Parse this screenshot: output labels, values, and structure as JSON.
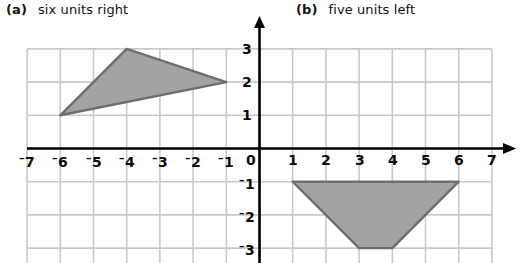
{
  "figure": {
    "title_a_tag": "(a)",
    "title_a_text": "six units right",
    "title_b_tag": "(b)",
    "title_b_text": "five units left"
  },
  "colors": {
    "background": "#ffffff",
    "grid": "#c9c9c9",
    "axis": "#000000",
    "shape_fill": "#a3a3a3",
    "shape_stroke": "#6e6e6e",
    "label_text": "#0b0b0b"
  },
  "chart_data": {
    "type": "scatter",
    "title": "",
    "xlabel": "",
    "ylabel": "",
    "xlim": [
      -7,
      7
    ],
    "ylim": [
      -3,
      3
    ],
    "grid": true,
    "legend": "none",
    "x_ticks": [
      "-7",
      "-6",
      "-5",
      "-4",
      "-3",
      "-2",
      "-1",
      "0",
      "1",
      "2",
      "3",
      "4",
      "5",
      "6",
      "7"
    ],
    "y_ticks": [
      "3",
      "2",
      "1",
      "-1",
      "-2",
      "-3"
    ],
    "origin_label": "0",
    "shapes": [
      {
        "name": "triangle",
        "label": "(a) six units right",
        "quadrant": "upper-left",
        "vertices": [
          [
            -6,
            1
          ],
          [
            -4,
            3
          ],
          [
            -1,
            2
          ]
        ]
      },
      {
        "name": "trapezoid",
        "label": "(b) five units left",
        "quadrant": "lower-right",
        "vertices": [
          [
            1,
            -1
          ],
          [
            6,
            -1
          ],
          [
            4,
            -3
          ],
          [
            3,
            -3
          ]
        ]
      }
    ]
  },
  "x_tick_labels": [
    {
      "value": -7,
      "sign": "neg",
      "digit": "7"
    },
    {
      "value": -6,
      "sign": "neg",
      "digit": "6"
    },
    {
      "value": -5,
      "sign": "neg",
      "digit": "5"
    },
    {
      "value": -4,
      "sign": "neg",
      "digit": "4"
    },
    {
      "value": -3,
      "sign": "neg",
      "digit": "3"
    },
    {
      "value": -2,
      "sign": "neg",
      "digit": "2"
    },
    {
      "value": -1,
      "sign": "neg",
      "digit": "1"
    },
    {
      "value": 0,
      "sign": "pos",
      "digit": "0"
    },
    {
      "value": 1,
      "sign": "pos",
      "digit": "1"
    },
    {
      "value": 2,
      "sign": "pos",
      "digit": "2"
    },
    {
      "value": 3,
      "sign": "pos",
      "digit": "3"
    },
    {
      "value": 4,
      "sign": "pos",
      "digit": "4"
    },
    {
      "value": 5,
      "sign": "pos",
      "digit": "5"
    },
    {
      "value": 6,
      "sign": "pos",
      "digit": "6"
    },
    {
      "value": 7,
      "sign": "pos",
      "digit": "7"
    }
  ],
  "y_tick_labels": [
    {
      "value": 3,
      "sign": "pos",
      "digit": "3"
    },
    {
      "value": 2,
      "sign": "pos",
      "digit": "2"
    },
    {
      "value": 1,
      "sign": "pos",
      "digit": "1"
    },
    {
      "value": -1,
      "sign": "neg",
      "digit": "1"
    },
    {
      "value": -2,
      "sign": "neg",
      "digit": "2"
    },
    {
      "value": -3,
      "sign": "neg",
      "digit": "3"
    }
  ]
}
